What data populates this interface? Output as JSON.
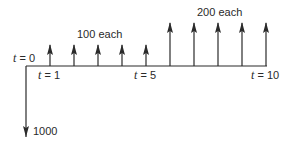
{
  "diagram": {
    "type": "cash-flow-diagram",
    "colors": {
      "line": "#2b2b2b",
      "text": "#2a2a2a",
      "background": "#ffffff"
    },
    "time_labels": {
      "t0": {
        "var": "t",
        "eq": " = 0"
      },
      "t1": {
        "var": "t",
        "eq": " = 1"
      },
      "t5": {
        "var": "t",
        "eq": " = 5"
      },
      "t10": {
        "var": "t",
        "eq": " = 10"
      }
    },
    "group_labels": {
      "first": "100 each",
      "second": "200 each"
    },
    "outflow_label": "1000",
    "cash_flows": [
      {
        "t": 0,
        "amount": -1000
      },
      {
        "t": 1,
        "amount": 100
      },
      {
        "t": 2,
        "amount": 100
      },
      {
        "t": 3,
        "amount": 100
      },
      {
        "t": 4,
        "amount": 100
      },
      {
        "t": 5,
        "amount": 100
      },
      {
        "t": 6,
        "amount": 200
      },
      {
        "t": 7,
        "amount": 200
      },
      {
        "t": 8,
        "amount": 200
      },
      {
        "t": 9,
        "amount": 200
      },
      {
        "t": 10,
        "amount": 200
      }
    ]
  }
}
